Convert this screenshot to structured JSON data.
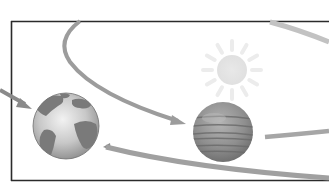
{
  "diagram": {
    "type": "orbital-illustration",
    "colors": {
      "background": "#ffffff",
      "frame": "#2b2b2b",
      "orbit": "#9a9a9a",
      "orbit_light": "#c4c4c4",
      "sun": "#e6e6e6",
      "sun_rays": "#ececec",
      "earth_ocean": "#d2d2d2",
      "earth_land": "#7c7c7c",
      "jupiter_base": "#8e8e8e",
      "jupiter_band": "#6f6f6f"
    },
    "elements": {
      "frame": {
        "x": 11,
        "y": 21,
        "bottom": 181
      },
      "sun": {
        "cx": 232,
        "cy": 70,
        "r": 15,
        "ray_outer": 29,
        "ray_inner": 20,
        "ray_count": 12
      },
      "earth": {
        "cx": 66,
        "cy": 126,
        "r": 33
      },
      "jupiter": {
        "cx": 223,
        "cy": 132,
        "r": 30
      }
    }
  }
}
